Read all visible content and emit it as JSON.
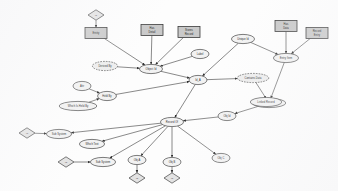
{
  "diagram": {
    "type": "er-diagram",
    "legend": {
      "rectangle": "entity",
      "ellipse": "attribute",
      "dashed_ellipse": "derived-attribute",
      "diamond": "relationship"
    },
    "colors": {
      "entity_fill": "#c9c9c9",
      "attribute_fill": "#f2f2f2",
      "relationship_fill": "#e2e2e2",
      "stroke": "#3d3d3d",
      "background": "#fdfdfd"
    }
  },
  "entities": [
    {
      "id": "e_left_top",
      "label": "Entity",
      "x": 96,
      "y": 33
    },
    {
      "id": "e_mid_top_a",
      "label": "Has\nDetail",
      "x": 152,
      "y": 30
    },
    {
      "id": "e_mid_top_b",
      "label": "Stores\nRecord",
      "x": 189,
      "y": 32
    },
    {
      "id": "e_right_top_a",
      "label": "Has\nData",
      "x": 286,
      "y": 26
    },
    {
      "id": "e_right_top_b",
      "label": "Record\nEntry",
      "x": 317,
      "y": 33
    }
  ],
  "attributes": [
    {
      "id": "a_derived_left",
      "label": "Derived By",
      "x": 105,
      "y": 66,
      "derived": true
    },
    {
      "id": "a_hub_upper",
      "label": "Object Id",
      "x": 151,
      "y": 69,
      "derived": false
    },
    {
      "id": "a_small_right",
      "label": "Label",
      "x": 200,
      "y": 54,
      "derived": false
    },
    {
      "id": "a_node_a",
      "label": "Attr",
      "x": 82,
      "y": 86,
      "derived": false
    },
    {
      "id": "a_node_b",
      "label": "Held By",
      "x": 107,
      "y": 96,
      "derived": false
    },
    {
      "id": "a_node_c",
      "label": "Which Is Held By",
      "x": 78,
      "y": 106,
      "derived": false
    },
    {
      "id": "a_center",
      "label": "Id_A",
      "x": 198,
      "y": 80,
      "derived": false
    },
    {
      "id": "a_unique_right",
      "label": "Unique Id",
      "x": 243,
      "y": 39,
      "derived": false
    },
    {
      "id": "a_store_right",
      "label": "Entry Item",
      "x": 286,
      "y": 58,
      "derived": false
    },
    {
      "id": "a_derived_right",
      "label": "Contains Data",
      "x": 253,
      "y": 78,
      "derived": true
    },
    {
      "id": "a_lower_right",
      "label": "List Of Record",
      "x": 269,
      "y": 103,
      "derived": false
    },
    {
      "id": "a_hub_main",
      "label": "Record Of",
      "x": 172,
      "y": 122,
      "derived": false
    },
    {
      "id": "a_obj_right",
      "label": "Obj Id",
      "x": 227,
      "y": 116,
      "derived": false
    },
    {
      "id": "a_link_top_right",
      "label": "Linked Record",
      "x": 266,
      "y": 102,
      "derived": false
    },
    {
      "id": "a_left_mid",
      "label": "Sub System",
      "x": 59,
      "y": 134,
      "derived": false
    },
    {
      "id": "a_left_small",
      "label": "Which Text",
      "x": 92,
      "y": 144,
      "derived": false
    },
    {
      "id": "a_left_low",
      "label": "Sub System",
      "x": 103,
      "y": 162,
      "derived": false
    },
    {
      "id": "a_bottom_a",
      "label": "Obj A",
      "x": 137,
      "y": 160,
      "derived": false
    },
    {
      "id": "a_bottom_b",
      "label": "Obj B",
      "x": 172,
      "y": 162,
      "derived": false
    },
    {
      "id": "a_bottom_c",
      "label": "Obj C",
      "x": 221,
      "y": 158,
      "derived": false
    }
  ],
  "relationships": [
    {
      "id": "r_top_left",
      "label": "Is",
      "x": 96,
      "y": 15
    },
    {
      "id": "r_left_mid",
      "label": "Id",
      "x": 27,
      "y": 133
    },
    {
      "id": "r_left_low",
      "label": "Id",
      "x": 66,
      "y": 162
    },
    {
      "id": "r_bottom_a",
      "label": "Id",
      "x": 137,
      "y": 178
    },
    {
      "id": "r_bottom_b",
      "label": "Id",
      "x": 172,
      "y": 178
    }
  ],
  "edges": [
    {
      "from": "r_top_left",
      "to": "e_left_top",
      "arrow": true
    },
    {
      "from": "e_left_top",
      "to": "a_hub_upper",
      "arrow": true
    },
    {
      "from": "e_mid_top_a",
      "to": "a_hub_upper",
      "arrow": true
    },
    {
      "from": "e_mid_top_b",
      "to": "a_hub_upper",
      "arrow": true
    },
    {
      "from": "a_derived_left",
      "to": "a_hub_upper",
      "arrow": true
    },
    {
      "from": "a_small_right",
      "to": "a_hub_upper",
      "arrow": true
    },
    {
      "from": "a_hub_upper",
      "to": "a_center",
      "arrow": true
    },
    {
      "from": "a_node_a",
      "to": "a_node_b",
      "arrow": true
    },
    {
      "from": "a_node_c",
      "to": "a_node_b",
      "arrow": true
    },
    {
      "from": "a_node_b",
      "to": "a_center",
      "arrow": true
    },
    {
      "from": "a_unique_right",
      "to": "a_center",
      "arrow": true
    },
    {
      "from": "a_unique_right",
      "to": "a_store_right",
      "arrow": true
    },
    {
      "from": "e_right_top_a",
      "to": "a_store_right",
      "arrow": true
    },
    {
      "from": "e_right_top_b",
      "to": "a_store_right",
      "arrow": true
    },
    {
      "from": "a_center",
      "to": "a_derived_right",
      "arrow": true
    },
    {
      "from": "a_derived_right",
      "to": "a_lower_right",
      "arrow": true
    },
    {
      "from": "a_store_right",
      "to": "a_lower_right",
      "arrow": true
    },
    {
      "from": "a_lower_right",
      "to": "a_obj_right",
      "arrow": true
    },
    {
      "from": "a_obj_right",
      "to": "a_hub_main",
      "arrow": true
    },
    {
      "from": "a_center",
      "to": "a_hub_main",
      "arrow": true
    },
    {
      "from": "a_hub_main",
      "to": "a_left_mid",
      "arrow": true
    },
    {
      "from": "a_hub_main",
      "to": "a_left_small",
      "arrow": true
    },
    {
      "from": "a_hub_main",
      "to": "a_left_low",
      "arrow": true
    },
    {
      "from": "a_hub_main",
      "to": "a_bottom_a",
      "arrow": true
    },
    {
      "from": "a_hub_main",
      "to": "a_bottom_b",
      "arrow": true
    },
    {
      "from": "a_hub_main",
      "to": "a_bottom_c",
      "arrow": true
    },
    {
      "from": "r_left_mid",
      "to": "a_left_mid",
      "arrow": true
    },
    {
      "from": "r_left_low",
      "to": "a_left_low",
      "arrow": true
    },
    {
      "from": "a_bottom_a",
      "to": "r_bottom_a",
      "arrow": true
    },
    {
      "from": "a_bottom_b",
      "to": "r_bottom_b",
      "arrow": true
    }
  ]
}
